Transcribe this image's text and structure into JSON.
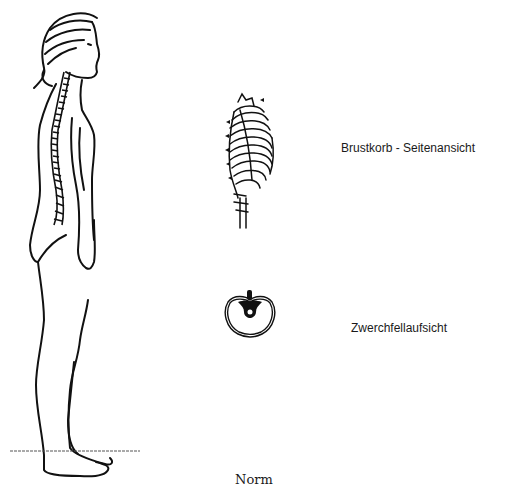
{
  "figure": {
    "caption": "Norm",
    "panels": [
      {
        "id": "body-profile",
        "description": "standing female figure, side view, with spine visible"
      },
      {
        "id": "ribcage-side",
        "label": "Brustkorb - Seitenansicht"
      },
      {
        "id": "diaphragm-top",
        "label": "Zwerchfellaufsicht"
      }
    ]
  },
  "labels": {
    "ribcage": "Brustkorb - Seitenansicht",
    "diaphragm": "Zwerchfellaufsicht",
    "caption": "Norm"
  },
  "colors": {
    "ink": "#111111",
    "background": "#ffffff"
  }
}
